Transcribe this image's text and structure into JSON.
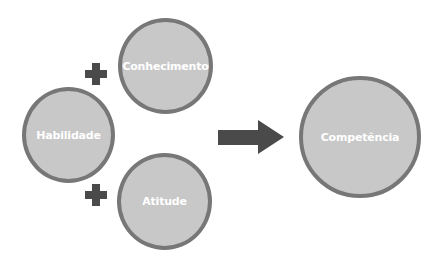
{
  "diagram": {
    "inputs": [
      {
        "id": "conhecimento",
        "label": "Conhecimento"
      },
      {
        "id": "habilidade",
        "label": "Habilidade"
      },
      {
        "id": "atitude",
        "label": "Atitude"
      }
    ],
    "operators": [
      "+",
      "+"
    ],
    "output": {
      "id": "competencia",
      "label": "Competência"
    },
    "colors": {
      "circle_fill": "#c8c8c8",
      "circle_border": "#777777",
      "arrow": "#4a4a4a",
      "plus": "#4a4a4a",
      "text": "#ffffff"
    }
  }
}
